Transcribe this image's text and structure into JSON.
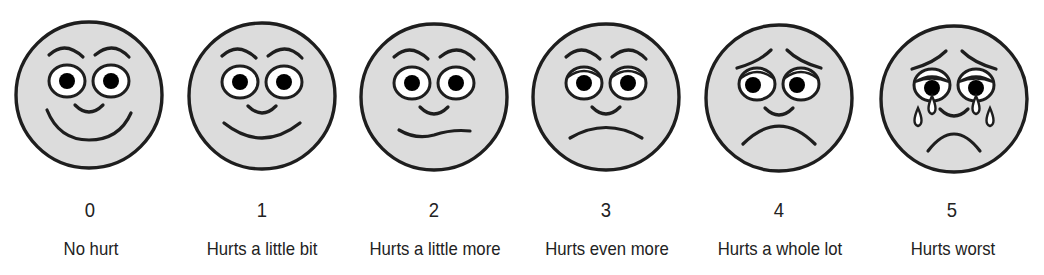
{
  "scale": {
    "colors": {
      "face_fill": "#dcdcdc",
      "stroke": "#1e1e1e",
      "eye_white": "#ffffff",
      "pupil": "#000000"
    },
    "faces": [
      {
        "rating": "0",
        "label": "No hurt",
        "cx": 89,
        "cy": 95,
        "expression": "big-smile"
      },
      {
        "rating": "1",
        "label": "Hurts a little bit",
        "cx": 262,
        "cy": 96,
        "expression": "smile"
      },
      {
        "rating": "2",
        "label": "Hurts a little more",
        "cx": 434,
        "cy": 97,
        "expression": "wavy"
      },
      {
        "rating": "3",
        "label": "Hurts even more",
        "cx": 606,
        "cy": 97,
        "expression": "slight-frown"
      },
      {
        "rating": "4",
        "label": "Hurts a whole lot",
        "cx": 779,
        "cy": 98,
        "expression": "frown"
      },
      {
        "rating": "5",
        "label": "Hurts worst",
        "cx": 954,
        "cy": 99,
        "expression": "crying"
      }
    ]
  }
}
